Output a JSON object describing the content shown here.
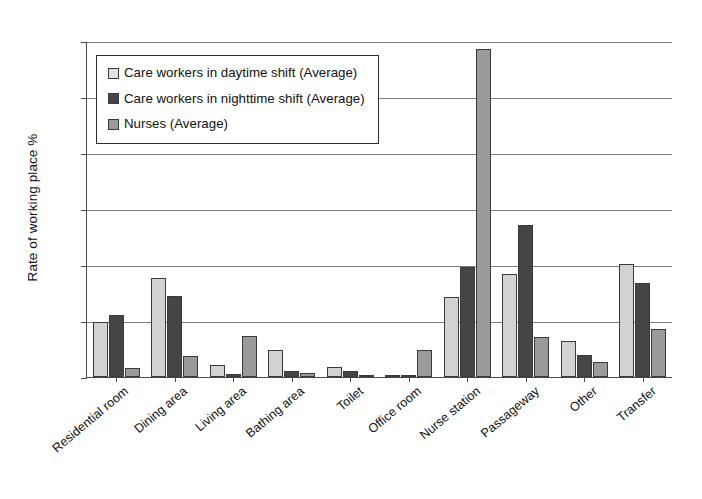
{
  "chart_data": {
    "type": "bar",
    "title": "",
    "xlabel": "",
    "ylabel": "Rate of working place  %",
    "ylim": [
      0,
      60
    ],
    "yticks": [
      0,
      10,
      20,
      30,
      40,
      50,
      60
    ],
    "grid": true,
    "legend_position": "top-left-inside",
    "categories": [
      "Residential room",
      "Dining area",
      "Living area",
      "Bathing area",
      "Toilet",
      "Office room",
      "Nurse station",
      "Passageway",
      "Other",
      "Transfer"
    ],
    "series": [
      {
        "name": "Care workers in daytime shift (Average)",
        "color": "#d2d2d2",
        "values": [
          9.9,
          17.7,
          2.1,
          4.8,
          1.8,
          0.2,
          14.2,
          18.4,
          6.5,
          20.2
        ]
      },
      {
        "name": "Care workers in nighttime shift (Average)",
        "color": "#454545",
        "values": [
          11.0,
          14.4,
          0.5,
          1.0,
          1.1,
          0.2,
          19.7,
          27.2,
          4.0,
          16.8
        ]
      },
      {
        "name": "Nurses (Average)",
        "color": "#9a9a9a",
        "values": [
          1.6,
          3.7,
          7.3,
          0.8,
          0.3,
          4.9,
          58.5,
          7.1,
          2.7,
          8.6
        ]
      }
    ]
  }
}
